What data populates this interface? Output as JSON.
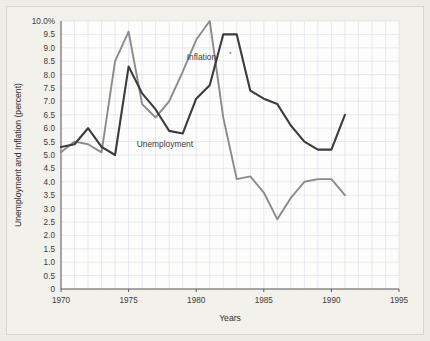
{
  "chart_data": {
    "type": "line",
    "title": "",
    "xlabel": "Years",
    "ylabel": "Unemployment and Inflation (percent)",
    "xlim": [
      1970,
      1995
    ],
    "ylim": [
      0,
      10
    ],
    "grid": true,
    "legend_position": "inline-annotation",
    "x_ticks": [
      "1970",
      "1975",
      "1980",
      "1985",
      "1990",
      "1995"
    ],
    "x_tick_values": [
      1970,
      1975,
      1980,
      1985,
      1990,
      1995
    ],
    "y_ticks": [
      "10.0%",
      "9.5",
      "9.0",
      "8.5",
      "8.0",
      "7.5",
      "7.0",
      "6.5",
      "6.0",
      "5.5",
      "5.0",
      "4.5",
      "4.0",
      "3.5",
      "3.0",
      "2.5",
      "2.0",
      "1.5",
      "1.0",
      "0.5",
      "0"
    ],
    "y_tick_values": [
      10.0,
      9.5,
      9.0,
      8.5,
      8.0,
      7.5,
      7.0,
      6.5,
      6.0,
      5.5,
      5.0,
      4.5,
      4.0,
      3.5,
      3.0,
      2.5,
      2.0,
      1.5,
      1.0,
      0.5,
      0
    ],
    "x": [
      1970,
      1971,
      1972,
      1973,
      1974,
      1975,
      1976,
      1977,
      1978,
      1979,
      1980,
      1981,
      1982,
      1983,
      1984,
      1985,
      1986,
      1987,
      1988,
      1989,
      1990,
      1991
    ],
    "series": [
      {
        "name": "Unemployment",
        "label": "Unemployment",
        "color": "#3c3c3c",
        "values": [
          5.3,
          5.4,
          6.0,
          5.3,
          5.0,
          8.3,
          7.3,
          6.7,
          5.9,
          5.8,
          7.1,
          7.6,
          9.5,
          9.5,
          7.4,
          7.1,
          6.9,
          6.1,
          5.5,
          5.2,
          5.2,
          6.5
        ]
      },
      {
        "name": "Inflation",
        "label": "Inflation",
        "label_footnote": "*",
        "color": "#8b8b8b",
        "values": [
          5.1,
          5.5,
          5.4,
          5.1,
          8.5,
          9.6,
          6.9,
          6.4,
          7.0,
          8.1,
          9.3,
          10.0,
          6.4,
          4.1,
          4.2,
          3.6,
          2.6,
          3.4,
          4.0,
          4.1,
          4.1,
          3.5
        ]
      }
    ],
    "annotations": [
      {
        "text": "Inflation",
        "x": 1979.3,
        "y": 8.55,
        "footnote": "*"
      },
      {
        "text": "Unemployment",
        "x": 1975.6,
        "y": 5.3
      }
    ]
  }
}
